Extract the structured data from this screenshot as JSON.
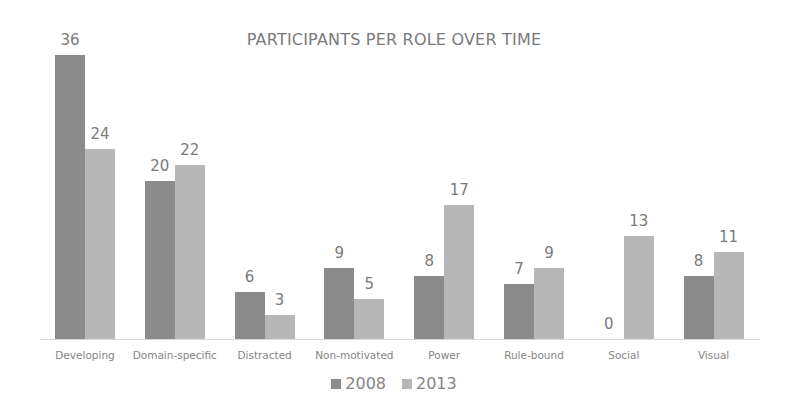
{
  "chart_data": {
    "type": "bar",
    "title": "PARTICIPANTS PER ROLE OVER TIME",
    "xlabel": "",
    "ylabel": "",
    "categories": [
      "Developing",
      "Domain-specific",
      "Distracted",
      "Non-motivated",
      "Power",
      "Rule-bound",
      "Social",
      "Visual"
    ],
    "series": [
      {
        "name": "2008",
        "color": "#8b8b8b",
        "values": [
          36,
          20,
          6,
          9,
          8,
          7,
          0,
          8
        ]
      },
      {
        "name": "2013",
        "color": "#b7b7b7",
        "values": [
          24,
          22,
          3,
          5,
          17,
          9,
          13,
          11
        ]
      }
    ],
    "ylim": [
      0,
      36
    ],
    "grid": false,
    "legend_position": "bottom",
    "data_labels": true
  },
  "labels": {
    "title": "PARTICIPANTS PER ROLE OVER TIME",
    "legend": [
      "2008",
      "2013"
    ]
  }
}
